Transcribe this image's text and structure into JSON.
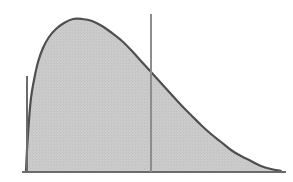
{
  "figure": {
    "name": "skewed-density-curve",
    "background_color": "#ffffff",
    "width": 293,
    "height": 182
  },
  "style": {
    "curve_stroke_color": "#4f4f4f",
    "curve_stroke_width": 2.2,
    "fill_color": "#c9c9c9",
    "fill_texture_color": "#bdbdbd",
    "axis_color": "#6b6b6b",
    "axis_width": 1.6,
    "reference_line_color": "#8d8d8d",
    "reference_line_width": 1.3
  },
  "axes": {
    "baseline": {
      "name": "x-axis-baseline",
      "x_start": 22,
      "x_end": 286,
      "y": 172
    },
    "left_edge": {
      "name": "left-vertical-edge",
      "x": 27,
      "y_top": 76,
      "y_bottom": 172
    }
  },
  "reference_line": {
    "name": "vertical-reference-line",
    "x": 151,
    "y_top": 14,
    "y_bottom": 172,
    "label": ""
  },
  "chart_data": {
    "type": "area",
    "title": "",
    "subtitle": "",
    "xlabel": "",
    "ylabel": "",
    "grid": false,
    "legend": false,
    "legend_position": "none",
    "xlim": [
      0,
      293
    ],
    "ylim": [
      0,
      182
    ],
    "annotations": [
      {
        "kind": "vertical-line",
        "x": 151,
        "note": "reference line crossing the density curve"
      }
    ],
    "series": [
      {
        "name": "density",
        "fill": true,
        "x": [
          26,
          27,
          29,
          31,
          34,
          38,
          43,
          49,
          56,
          64,
          73,
          82,
          92,
          102,
          112,
          122,
          132,
          141,
          151,
          161,
          171,
          181,
          191,
          201,
          211,
          221,
          231,
          241,
          251,
          261,
          271,
          281
        ],
        "y": [
          172,
          150,
          120,
          98,
          80,
          62,
          48,
          37,
          29,
          23,
          19,
          19,
          21,
          26,
          33,
          41,
          51,
          61,
          72,
          83,
          94,
          105,
          115,
          125,
          134,
          142,
          150,
          156,
          161,
          166,
          169,
          171
        ]
      }
    ],
    "peak": {
      "x": 77,
      "y": 19
    },
    "crossing_point": {
      "x": 151,
      "y": 72
    }
  }
}
